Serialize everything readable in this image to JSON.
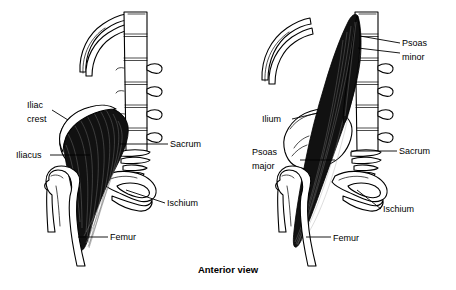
{
  "figure": {
    "caption": "Anterior view",
    "panels": [
      {
        "id": "left-panel",
        "name": "iliacus-figure",
        "labels": [
          {
            "id": "iliac-crest",
            "text_line1": "Iliac",
            "text_line2": "crest",
            "x": 27,
            "y": 108,
            "anchor": "start"
          },
          {
            "id": "iliacus",
            "text": "Iliacus",
            "x": 16,
            "y": 158,
            "anchor": "start"
          },
          {
            "id": "sacrum",
            "text": "Sacrum",
            "x": 170,
            "y": 145,
            "anchor": "start"
          },
          {
            "id": "ischium",
            "text": "Ischium",
            "x": 167,
            "y": 205,
            "anchor": "start"
          },
          {
            "id": "femur",
            "text": "Femur",
            "x": 110,
            "y": 239,
            "anchor": "start"
          }
        ]
      },
      {
        "id": "right-panel",
        "name": "psoas-figure",
        "labels": [
          {
            "id": "psoas-minor",
            "text_line1": "Psoas",
            "text_line2": "minor",
            "x": 402,
            "y": 46,
            "anchor": "start"
          },
          {
            "id": "ilium",
            "text": "Ilium",
            "x": 262,
            "y": 122,
            "anchor": "start"
          },
          {
            "id": "psoas-major",
            "text_line1": "Psoas",
            "text_line2": "major",
            "x": 252,
            "y": 155,
            "anchor": "start"
          },
          {
            "id": "sacrum",
            "text": "Sacrum",
            "x": 399,
            "y": 152,
            "anchor": "start"
          },
          {
            "id": "ischium",
            "text": "Ischium",
            "x": 383,
            "y": 211,
            "anchor": "start"
          },
          {
            "id": "femur",
            "text": "Femur",
            "x": 333,
            "y": 240,
            "anchor": "start"
          }
        ]
      }
    ],
    "colors": {
      "background": "#ffffff",
      "ink": "#000000",
      "muscle": "#111111",
      "bone_fill": "#ffffff"
    },
    "structures": [
      "ribs",
      "lumbar-vertebrae",
      "sacrum",
      "coccyx",
      "ilium",
      "iliac-crest",
      "ischium",
      "pubis",
      "femur",
      "iliacus-muscle",
      "psoas-major-muscle",
      "psoas-minor-muscle"
    ]
  }
}
